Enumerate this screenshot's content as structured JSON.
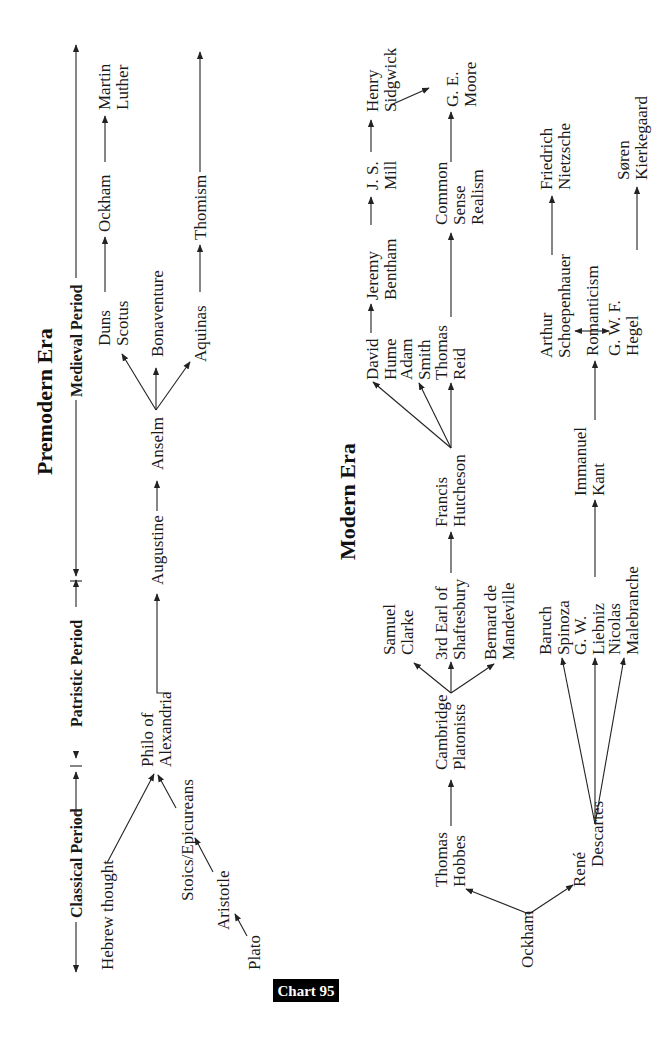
{
  "chart_label": "Chart 95",
  "eras": {
    "premodern": {
      "title": "Premodern Era",
      "periods": [
        "Classical Period",
        "Patristic Period",
        "Medieval Period"
      ],
      "nodes": {
        "hebrew_thought": [
          "Hebrew thought"
        ],
        "plato": [
          "Plato"
        ],
        "aristotle": [
          "Aristotle"
        ],
        "stoics": [
          "Stoics/Epicureans"
        ],
        "philo": [
          "Philo of",
          "Alexandria"
        ],
        "augustine": [
          "Augustine"
        ],
        "anselm": [
          "Anselm"
        ],
        "duns_scotus": [
          "Duns",
          "Scotus"
        ],
        "bonaventure": [
          "Bonaventure"
        ],
        "aquinas": [
          "Aquinas"
        ],
        "ockham": [
          "Ockham"
        ],
        "thomism": [
          "Thomism"
        ],
        "martin_luther": [
          "Martin",
          "Luther"
        ]
      },
      "edges": [
        [
          "plato",
          "aristotle"
        ],
        [
          "aristotle",
          "stoics"
        ],
        [
          "stoics",
          "philo"
        ],
        [
          "hebrew_thought",
          "philo"
        ],
        [
          "philo",
          "augustine"
        ],
        [
          "augustine",
          "anselm"
        ],
        [
          "anselm",
          "duns_scotus"
        ],
        [
          "anselm",
          "bonaventure"
        ],
        [
          "anselm",
          "aquinas"
        ],
        [
          "duns_scotus",
          "ockham"
        ],
        [
          "ockham",
          "martin_luther"
        ],
        [
          "aquinas",
          "thomism"
        ]
      ]
    },
    "modern": {
      "title": "Modern Era",
      "nodes": {
        "ockham": [
          "Ockham"
        ],
        "hobbes": [
          "Thomas",
          "Hobbes"
        ],
        "descartes": [
          "René",
          "Descartes"
        ],
        "cambridge": [
          "Cambridge",
          "Platonists"
        ],
        "clarke": [
          "Samuel",
          "Clarke"
        ],
        "shaftesbury": [
          "3rd Earl of",
          "Shaftesbury"
        ],
        "mandeville": [
          "Bernard de",
          "Mandeville"
        ],
        "hutcheson": [
          "Francis",
          "Hutcheson"
        ],
        "hume": [
          "David",
          "Hume"
        ],
        "smith": [
          "Adam",
          "Smith"
        ],
        "reid": [
          "Thomas",
          "Reid"
        ],
        "bentham": [
          "Jeremy",
          "Bentham"
        ],
        "mill": [
          "J. S.",
          "Mill"
        ],
        "sidgwick": [
          "Henry",
          "Sidgwick"
        ],
        "common_sense": [
          "Common",
          "Sense",
          "Realism"
        ],
        "moore": [
          "G. E.",
          "Moore"
        ],
        "spinoza": [
          "Baruch",
          "Spinoza"
        ],
        "leibniz": [
          "G. W.",
          "Liebniz"
        ],
        "malebranche": [
          "Nicolas",
          "Malebranche"
        ],
        "kant": [
          "Immanuel",
          "Kant"
        ],
        "romanticism": [
          "Romanticism"
        ],
        "schopenhauer": [
          "Arthur",
          "Schoepenhauer"
        ],
        "hegel": [
          "G. W. F.",
          "Hegel"
        ],
        "nietzsche": [
          "Friedrich",
          "Nietzsche"
        ],
        "kierkegaard": [
          "Søren",
          "Kierkegaard"
        ]
      },
      "edges": [
        [
          "ockham",
          "hobbes"
        ],
        [
          "ockham",
          "descartes"
        ],
        [
          "hobbes",
          "cambridge"
        ],
        [
          "cambridge",
          "clarke"
        ],
        [
          "cambridge",
          "shaftesbury"
        ],
        [
          "cambridge",
          "mandeville"
        ],
        [
          "shaftesbury",
          "hutcheson"
        ],
        [
          "hutcheson",
          "hume"
        ],
        [
          "hutcheson",
          "smith"
        ],
        [
          "hutcheson",
          "reid"
        ],
        [
          "hume",
          "bentham"
        ],
        [
          "bentham",
          "mill"
        ],
        [
          "mill",
          "sidgwick"
        ],
        [
          "sidgwick",
          "moore"
        ],
        [
          "reid",
          "common_sense"
        ],
        [
          "common_sense",
          "moore"
        ],
        [
          "descartes",
          "spinoza"
        ],
        [
          "descartes",
          "leibniz"
        ],
        [
          "descartes",
          "malebranche"
        ],
        [
          "leibniz",
          "kant"
        ],
        [
          "kant",
          "romanticism"
        ],
        [
          "romanticism",
          "schopenhauer"
        ],
        [
          "romanticism",
          "hegel"
        ],
        [
          "schopenhauer",
          "nietzsche"
        ],
        [
          "hegel",
          "kierkegaard"
        ]
      ]
    }
  }
}
